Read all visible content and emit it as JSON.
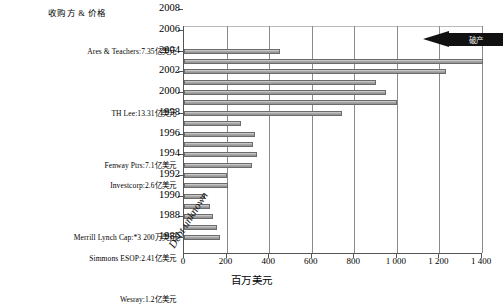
{
  "chart_data": {
    "type": "bar",
    "orientation": "horizontal",
    "title": "",
    "header_label": "收购方 & 价格",
    "xlabel": "百万美元",
    "ylabel": "",
    "xlim": [
      0,
      1400
    ],
    "xticks": [
      0,
      200,
      400,
      600,
      800,
      1000,
      1200,
      1400
    ],
    "xticklabels": [
      "0",
      "200",
      "400",
      "600",
      "800",
      "1 000",
      "1 200",
      "1 400"
    ],
    "grid": "vertical",
    "legend": "none",
    "year_ticks": [
      "1986",
      "1988",
      "1990",
      "1992",
      "1994",
      "1996",
      "1998",
      "2000",
      "2002",
      "2004",
      "2006",
      "2008"
    ],
    "bars": [
      {
        "row": 18,
        "value": 450,
        "year": "2008+",
        "acquirer": "Ares & Teachers:7.35亿美元"
      },
      {
        "row": 17,
        "value": 1400,
        "year": "2008",
        "acquirer": "",
        "overflow": true
      },
      {
        "row": 16,
        "value": 1230,
        "year": "",
        "acquirer": ""
      },
      {
        "row": 15,
        "value": 900,
        "year": "2006",
        "acquirer": ""
      },
      {
        "row": 14,
        "value": 950,
        "year": "",
        "acquirer": ""
      },
      {
        "row": 13,
        "value": 1000,
        "year": "2004",
        "acquirer": ""
      },
      {
        "row": 12,
        "value": 740,
        "year": "",
        "acquirer": "TH Lee:13.31亿美元"
      },
      {
        "row": 11,
        "value": 270,
        "year": "2002",
        "acquirer": ""
      },
      {
        "row": 10,
        "value": 335,
        "year": "",
        "acquirer": ""
      },
      {
        "row": 9,
        "value": 325,
        "year": "2000",
        "acquirer": ""
      },
      {
        "row": 8,
        "value": 345,
        "year": "",
        "acquirer": ""
      },
      {
        "row": 7,
        "value": 320,
        "year": "1998",
        "acquirer": "Fenway Ptrs:7.1亿美元"
      },
      {
        "row": 6,
        "value": 200,
        "year": "",
        "acquirer": ""
      },
      {
        "row": 5,
        "value": 205,
        "year": "1996",
        "acquirer": "Investcorp:2.6亿美元"
      },
      {
        "row": 4,
        "value": 100,
        "year": "",
        "acquirer": ""
      },
      {
        "row": 3,
        "value": 120,
        "year": "1994",
        "acquirer": ""
      },
      {
        "row": 2,
        "value": 135,
        "year": "",
        "acquirer": ""
      },
      {
        "row": 1,
        "value": 155,
        "year": "1992",
        "acquirer": ""
      },
      {
        "row": 0,
        "value": 170,
        "year": "",
        "acquirer": "Merrill Lynch Cap:*3 200万美元"
      }
    ],
    "empty_rows": [
      {
        "year": "1990",
        "acquirer": "Simmons ESOP:2.41亿美元"
      },
      {
        "year": "1988",
        "acquirer": ""
      },
      {
        "year": "1986",
        "acquirer": "Wesray:1.2亿美元"
      }
    ],
    "annotations": [
      {
        "name": "debt-unknown",
        "text": "Debt unknown"
      },
      {
        "name": "bankruptcy-arrow",
        "text": "破产"
      }
    ]
  },
  "axis": {
    "x_title": "百万美元",
    "ticks": [
      "0",
      "200",
      "400",
      "600",
      "800",
      "1 000",
      "1 200",
      "1 400"
    ]
  },
  "labels": {
    "header": "收购方 & 价格",
    "acquirers": [
      "Ares & Teachers:7.35亿美元",
      "TH Lee:13.31亿美元",
      "Fenway Ptrs:7.1亿美元",
      "Investcorp:2.6亿美元",
      "Merrill Lynch Cap:*3 200万美元",
      "Simmons ESOP:2.41亿美元",
      "Wesray:1.2亿美元"
    ],
    "years": [
      "2008",
      "2006",
      "2004",
      "2002",
      "2000",
      "1998",
      "1996",
      "1994",
      "1992",
      "1990",
      "1988",
      "1986"
    ],
    "debt_unknown": "Debt unknown",
    "bankruptcy": "破产"
  },
  "colors": {
    "bar_fill": "#a9a9a9",
    "bar_edge": "#6b6b6b",
    "grid": "#8a8a8a",
    "axis": "#555555",
    "arrow": "#111111"
  }
}
